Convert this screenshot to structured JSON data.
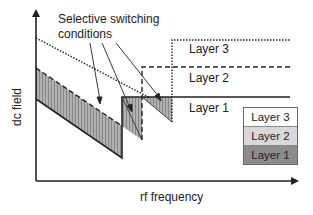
{
  "diagram": {
    "y_axis_label": "dc field",
    "x_axis_label": "rf frequency",
    "annotation": [
      "Selective switching",
      "conditions"
    ],
    "region_labels": [
      "Layer 3",
      "Layer 2",
      "Layer 1"
    ],
    "legend": [
      {
        "label": "Layer 3",
        "color": "#ffffff"
      },
      {
        "label": "Layer 2",
        "color": "#d9d9d9"
      },
      {
        "label": "Layer 1",
        "color": "#8c8c8c"
      }
    ],
    "line_styles": {
      "Layer 3": "dotted",
      "Layer 2": "dashed",
      "Layer 1": "solid"
    },
    "shade_color": "#a6a6a6"
  }
}
